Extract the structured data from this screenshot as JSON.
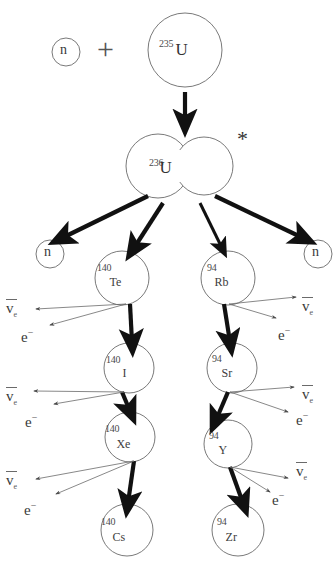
{
  "figure": {
    "width": 334,
    "height": 574,
    "background": "#ffffff",
    "stroke_thin": "#6a6a6a",
    "stroke_thick": "#111111",
    "text_color": "#333333"
  },
  "operators": {
    "plus": "+",
    "excited_state_asterisk": "*"
  },
  "nuclei": [
    {
      "id": "u235",
      "mass": "235",
      "symbol": "U",
      "cx": 185,
      "cy": 50,
      "r": 37,
      "mass_dx": -26,
      "mass_dy": -12,
      "sym_dx": 2,
      "sym_dy": -10,
      "sym_class": "sym"
    },
    {
      "id": "u236",
      "mass": "236",
      "symbol": "U",
      "cx": 180,
      "cy": 165,
      "r": 0,
      "mass_dx": -31,
      "mass_dy": -8,
      "sym_dx": -4,
      "sym_dy": -11,
      "sym_class": "sym"
    },
    {
      "id": "te140",
      "mass": "140",
      "symbol": "Te",
      "cx": 122,
      "cy": 278,
      "r": 27,
      "mass_dx": -25,
      "mass_dy": -16,
      "sym_dx": -2,
      "sym_dy": -3,
      "sym_class": "sym-small"
    },
    {
      "id": "i140",
      "mass": "140",
      "symbol": "I",
      "cx": 129,
      "cy": 368,
      "r": 25,
      "mass_dx": -23,
      "mass_dy": -14,
      "sym_dx": 2,
      "sym_dy": -4,
      "sym_class": "sym-small"
    },
    {
      "id": "xe140",
      "mass": "140",
      "symbol": "Xe",
      "cx": 130,
      "cy": 437,
      "r": 25,
      "mass_dx": -25,
      "mass_dy": -14,
      "sym_dx": -3,
      "sym_dy": -2,
      "sym_class": "sym-small"
    },
    {
      "id": "cs140",
      "mass": "140",
      "symbol": "Cs",
      "cx": 127,
      "cy": 530,
      "r": 26,
      "mass_dx": -26,
      "mass_dy": -14,
      "sym_dx": -3,
      "sym_dy": -2,
      "sym_class": "sym-small"
    },
    {
      "id": "rb94",
      "mass": "94",
      "symbol": "Rb",
      "cx": 228,
      "cy": 278,
      "r": 27,
      "mass_dx": -21,
      "mass_dy": -16,
      "sym_dx": -2,
      "sym_dy": -3,
      "sym_class": "sym-small"
    },
    {
      "id": "sr94",
      "mass": "94",
      "symbol": "Sr",
      "cx": 232,
      "cy": 368,
      "r": 25,
      "mass_dx": -20,
      "mass_dy": -15,
      "sym_dx": 0,
      "sym_dy": -3,
      "sym_class": "sym-small"
    },
    {
      "id": "y94",
      "mass": "94",
      "symbol": "Y",
      "cx": 228,
      "cy": 444,
      "r": 24,
      "mass_dx": -19,
      "mass_dy": -14,
      "sym_dx": 0,
      "sym_dy": -3,
      "sym_class": "sym-small"
    },
    {
      "id": "zr94",
      "mass": "94",
      "symbol": "Zr",
      "cx": 238,
      "cy": 530,
      "r": 26,
      "mass_dx": -21,
      "mass_dy": -14,
      "sym_dx": -1,
      "sym_dy": -2,
      "sym_class": "sym-small"
    }
  ],
  "neutrons": [
    {
      "id": "n-incident",
      "label": "n",
      "cx": 66,
      "cy": 52,
      "r": 14
    },
    {
      "id": "n-emitted-left",
      "label": "n",
      "cx": 50,
      "cy": 254,
      "r": 14
    },
    {
      "id": "n-emitted-right",
      "label": "n",
      "cx": 318,
      "cy": 254,
      "r": 14
    }
  ],
  "beta_products": [
    {
      "id": "nu-te",
      "kind": "antineutrino",
      "glyph": "v",
      "sub": "e",
      "x": 6,
      "y": 300
    },
    {
      "id": "e-te",
      "kind": "electron",
      "glyph": "e",
      "sup": "−",
      "x": 21,
      "y": 327
    },
    {
      "id": "nu-rb",
      "kind": "antineutrino",
      "glyph": "v",
      "sub": "e",
      "x": 302,
      "y": 298
    },
    {
      "id": "e-rb",
      "kind": "electron",
      "glyph": "e",
      "sup": "−",
      "x": 278,
      "y": 325
    },
    {
      "id": "nu-i",
      "kind": "antineutrino",
      "glyph": "v",
      "sub": "e",
      "x": 6,
      "y": 388
    },
    {
      "id": "e-i",
      "kind": "electron",
      "glyph": "e",
      "sup": "−",
      "x": 25,
      "y": 412
    },
    {
      "id": "nu-sr",
      "kind": "antineutrino",
      "glyph": "v",
      "sub": "e",
      "x": 302,
      "y": 386
    },
    {
      "id": "e-sr",
      "kind": "electron",
      "glyph": "e",
      "sup": "−",
      "x": 296,
      "y": 410
    },
    {
      "id": "nu-xe",
      "kind": "antineutrino",
      "glyph": "v",
      "sub": "e",
      "x": 6,
      "y": 472
    },
    {
      "id": "e-xe",
      "kind": "electron",
      "glyph": "e",
      "sup": "−",
      "x": 24,
      "y": 500
    },
    {
      "id": "nu-y",
      "kind": "antineutrino",
      "glyph": "v",
      "sub": "e",
      "x": 296,
      "y": 463
    },
    {
      "id": "e-y",
      "kind": "electron",
      "glyph": "e",
      "sup": "−",
      "x": 272,
      "y": 490
    }
  ],
  "arrows": {
    "capture": {
      "from": [
        185,
        92
      ],
      "to": [
        185,
        122
      ],
      "style": "thick"
    },
    "fission": [
      {
        "id": "fission-to-n-left",
        "from": [
          148,
          196
        ],
        "to": [
          62,
          238
        ],
        "style": "thick"
      },
      {
        "id": "fission-to-te",
        "from": [
          163,
          203
        ],
        "to": [
          134,
          248
        ],
        "style": "thick"
      },
      {
        "id": "fission-to-rb",
        "from": [
          200,
          203
        ],
        "to": [
          222,
          248
        ],
        "style": "medium"
      },
      {
        "id": "fission-to-n-right",
        "from": [
          215,
          196
        ],
        "to": [
          303,
          238
        ],
        "style": "thick"
      }
    ],
    "decays": [
      {
        "id": "te-to-i",
        "from": [
          130,
          304
        ],
        "to": [
          132,
          342
        ],
        "style": "thick"
      },
      {
        "id": "i-to-xe",
        "from": [
          122,
          392
        ],
        "to": [
          130,
          411
        ],
        "style": "thick"
      },
      {
        "id": "xe-to-cs",
        "from": [
          134,
          461
        ],
        "to": [
          128,
          503
        ],
        "style": "thick"
      },
      {
        "id": "rb-to-sr",
        "from": [
          224,
          304
        ],
        "to": [
          230,
          342
        ],
        "style": "thick"
      },
      {
        "id": "sr-to-y",
        "from": [
          228,
          392
        ],
        "to": [
          216,
          420
        ],
        "style": "thick"
      },
      {
        "id": "y-to-zr",
        "from": [
          230,
          467
        ],
        "to": [
          243,
          503
        ],
        "style": "thick"
      }
    ],
    "emissions": [
      {
        "id": "te-emit-nu",
        "from": [
          126,
          304
        ],
        "to": [
          36,
          309
        ],
        "style": "thin"
      },
      {
        "id": "te-emit-e",
        "from": [
          126,
          304
        ],
        "to": [
          50,
          325
        ],
        "style": "thin"
      },
      {
        "id": "rb-emit-nu",
        "from": [
          229,
          304
        ],
        "to": [
          296,
          297
        ],
        "style": "thin"
      },
      {
        "id": "rb-emit-e",
        "from": [
          229,
          304
        ],
        "to": [
          276,
          318
        ],
        "style": "thin"
      },
      {
        "id": "i-emit-nu",
        "from": [
          124,
          392
        ],
        "to": [
          34,
          391
        ],
        "style": "thin"
      },
      {
        "id": "i-emit-e",
        "from": [
          124,
          392
        ],
        "to": [
          54,
          404
        ],
        "style": "thin"
      },
      {
        "id": "sr-emit-nu",
        "from": [
          230,
          392
        ],
        "to": [
          294,
          387
        ],
        "style": "thin"
      },
      {
        "id": "sr-emit-e",
        "from": [
          230,
          392
        ],
        "to": [
          288,
          412
        ],
        "style": "thin"
      },
      {
        "id": "xe-emit-nu",
        "from": [
          134,
          461
        ],
        "to": [
          36,
          479
        ],
        "style": "thin"
      },
      {
        "id": "xe-emit-e",
        "from": [
          134,
          461
        ],
        "to": [
          56,
          494
        ],
        "style": "thin"
      },
      {
        "id": "y-emit-nu",
        "from": [
          230,
          467
        ],
        "to": [
          288,
          478
        ],
        "style": "thin"
      },
      {
        "id": "y-emit-e",
        "from": [
          230,
          467
        ],
        "to": [
          270,
          492
        ],
        "style": "thin"
      }
    ]
  },
  "u236_shape": {
    "left_lobe": {
      "cx": 158,
      "cy": 166,
      "r": 32
    },
    "right_lobe": {
      "cx": 204,
      "cy": 166,
      "r": 29
    }
  },
  "plus_position": {
    "x": 97,
    "y": 34
  },
  "asterisk_position": {
    "x": 237,
    "y": 128
  }
}
